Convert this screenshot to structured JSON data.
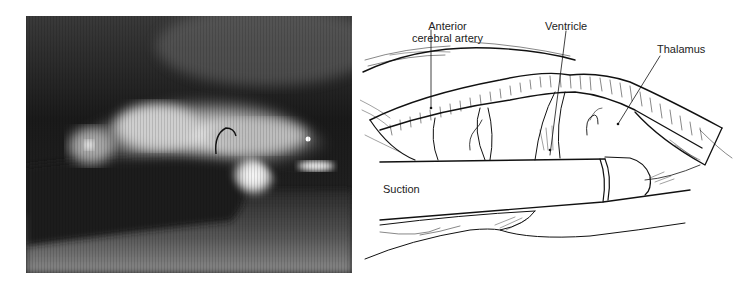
{
  "figure": {
    "left_panel": {
      "type": "intraoperative-photo",
      "description": "Grayscale endoscopic view of ventricle with suction tube"
    },
    "right_panel": {
      "type": "line-illustration",
      "labels": {
        "anterior_cerebral_artery_line1": "Anterior",
        "anterior_cerebral_artery_line2": "cerebral artery",
        "ventricle": "Ventricle",
        "thalamus": "Thalamus",
        "suction": "Suction"
      }
    }
  }
}
